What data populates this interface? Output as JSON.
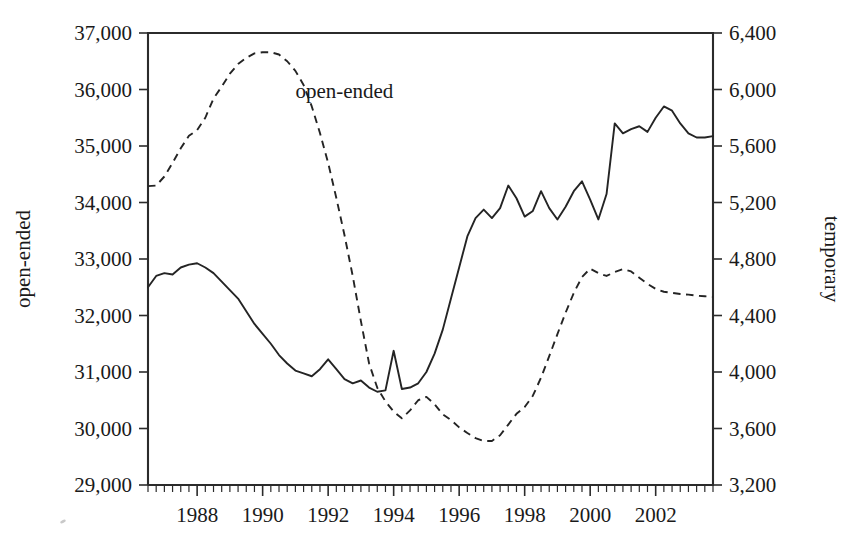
{
  "chart_data": {
    "type": "line",
    "title": "",
    "xlabel": "",
    "ylabel": "open-ended",
    "y2label": "temporary",
    "grid": false,
    "legend_position": "inline-annotation",
    "xlim": [
      1986.5,
      2003.75
    ],
    "ylim": [
      29000,
      37000
    ],
    "y2lim": [
      3200,
      6400
    ],
    "ytick_labels": [
      "29,000",
      "30,000",
      "31,000",
      "32,000",
      "33,000",
      "34,000",
      "35,000",
      "36,000",
      "37,000"
    ],
    "ytick_values": [
      29000,
      30000,
      31000,
      32000,
      33000,
      34000,
      35000,
      36000,
      37000
    ],
    "y2tick_labels": [
      "3,200",
      "3,600",
      "4,000",
      "4,400",
      "4,800",
      "5,200",
      "5,600",
      "6,000",
      "6,400"
    ],
    "y2tick_values": [
      3200,
      3600,
      4000,
      4400,
      4800,
      5200,
      5600,
      6000,
      6400
    ],
    "xtick_labels": [
      "1988",
      "1990",
      "1992",
      "1994",
      "1996",
      "1998",
      "2000",
      "2002"
    ],
    "xtick_values": [
      1988,
      1990,
      1992,
      1994,
      1996,
      1998,
      2000,
      2002
    ],
    "xminor_step": 0.25,
    "annotations": [
      {
        "text": "open-ended",
        "x": 1991.0,
        "y": 35850,
        "axis": "left"
      },
      {
        "text": "temporary",
        "x": 1988.4,
        "y": 30520,
        "axis": "right"
      }
    ],
    "series": [
      {
        "name": "open-ended",
        "axis": "left",
        "style": "dashed",
        "x": [
          1986.5,
          1986.75,
          1987.0,
          1987.25,
          1987.5,
          1987.75,
          1988.0,
          1988.25,
          1988.5,
          1988.75,
          1989.0,
          1989.25,
          1989.5,
          1989.75,
          1990.0,
          1990.25,
          1990.5,
          1990.75,
          1991.0,
          1991.25,
          1991.5,
          1991.75,
          1992.0,
          1992.25,
          1992.5,
          1992.75,
          1993.0,
          1993.25,
          1993.5,
          1993.75,
          1994.0,
          1994.25,
          1994.5,
          1994.75,
          1995.0,
          1995.25,
          1995.5,
          1995.75,
          1996.0,
          1996.25,
          1996.5,
          1996.75,
          1997.0,
          1997.25,
          1997.5,
          1997.75,
          1998.0,
          1998.25,
          1998.5,
          1998.75,
          1999.0,
          1999.25,
          1999.5,
          1999.75,
          2000.0,
          2000.25,
          2000.5,
          2000.75,
          2001.0,
          2001.25,
          2001.5,
          2001.75,
          2002.0,
          2002.25,
          2002.5,
          2002.75,
          2003.0,
          2003.25,
          2003.5,
          2003.75
        ],
        "y": [
          34290,
          34300,
          34460,
          34700,
          34960,
          35180,
          35280,
          35500,
          35840,
          36050,
          36280,
          36450,
          36560,
          36640,
          36660,
          36660,
          36620,
          36500,
          36330,
          36080,
          35700,
          35230,
          34700,
          34080,
          33420,
          32700,
          31900,
          31150,
          30720,
          30480,
          30300,
          30180,
          30320,
          30500,
          30560,
          30430,
          30250,
          30150,
          30020,
          29920,
          29830,
          29780,
          29780,
          29880,
          30070,
          30260,
          30380,
          30580,
          30900,
          31280,
          31670,
          32050,
          32400,
          32680,
          32830,
          32750,
          32700,
          32770,
          32820,
          32780,
          32670,
          32560,
          32470,
          32420,
          32400,
          32380,
          32370,
          32350,
          32340,
          32330
        ]
      },
      {
        "name": "temporary",
        "axis": "right",
        "style": "solid",
        "x": [
          1986.5,
          1986.75,
          1987.0,
          1987.25,
          1987.5,
          1987.75,
          1988.0,
          1988.25,
          1988.5,
          1988.75,
          1989.0,
          1989.25,
          1989.5,
          1989.75,
          1990.0,
          1990.25,
          1990.5,
          1990.75,
          1991.0,
          1991.25,
          1991.5,
          1991.75,
          1992.0,
          1992.25,
          1992.5,
          1992.75,
          1993.0,
          1993.25,
          1993.5,
          1993.75,
          1994.0,
          1994.25,
          1994.5,
          1994.75,
          1995.0,
          1995.25,
          1995.5,
          1995.75,
          1996.0,
          1996.25,
          1996.5,
          1996.75,
          1997.0,
          1997.25,
          1997.5,
          1997.75,
          1998.0,
          1998.25,
          1998.5,
          1998.75,
          1999.0,
          1999.25,
          1999.5,
          1999.75,
          2000.0,
          2000.25,
          2000.5,
          2000.75,
          2001.0,
          2001.25,
          2001.5,
          2001.75,
          2002.0,
          2002.25,
          2002.5,
          2002.75,
          2003.0,
          2003.25,
          2003.5,
          2003.75
        ],
        "y": [
          4600,
          4680,
          4700,
          4690,
          4740,
          4760,
          4770,
          4740,
          4700,
          4640,
          4580,
          4520,
          4430,
          4340,
          4270,
          4200,
          4120,
          4060,
          4010,
          3990,
          3970,
          4020,
          4090,
          4020,
          3950,
          3920,
          3940,
          3890,
          3860,
          3870,
          4150,
          3880,
          3890,
          3920,
          4000,
          4130,
          4300,
          4520,
          4740,
          4960,
          5090,
          5150,
          5090,
          5160,
          5320,
          5230,
          5100,
          5140,
          5280,
          5160,
          5080,
          5170,
          5280,
          5350,
          5220,
          5080,
          5260,
          5760,
          5690,
          5720,
          5740,
          5700,
          5800,
          5880,
          5850,
          5760,
          5690,
          5660,
          5660,
          5670
        ]
      }
    ]
  }
}
